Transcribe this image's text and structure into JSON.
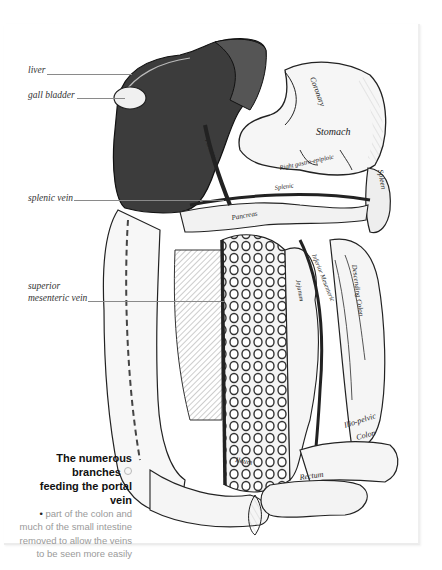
{
  "figure": {
    "labels": {
      "liver": "liver",
      "gall_bladder": "gall bladder",
      "splenic_vein": "splenic vein",
      "superior_mesenteric_vein_line1": "superior",
      "superior_mesenteric_vein_line2": "mesenteric vein"
    },
    "engraving_labels": {
      "coronary": "Coronary",
      "stomach": "Stomach",
      "right_gastroepiploic": "Right gastro-epiploic",
      "splenic": "Splenic",
      "pancreas": "Pancreas",
      "spleen": "Spleen",
      "portal_vein": "Portal Vein",
      "jejunum": "Jejunum",
      "inferior_mesenteric": "Inferior Mesenteric",
      "descending_colon": "Descending Colon",
      "ileum": "Ileum",
      "ilio_pelvic_colon_line1": "Ilio-pelvic",
      "ilio_pelvic_colon_line2": "Colon",
      "rectum": "Rectum"
    }
  },
  "caption": {
    "title_line1": "The numerous branches",
    "title_line2": "feeding the portal vein",
    "marker_icon": "circle-marker",
    "bullet": "•",
    "body_line1": "part of the colon and",
    "body_line2": "much of the small intestine",
    "body_line3": "removed to allow the veins",
    "body_line4": "to be seen more easily"
  },
  "colors": {
    "page": "#ffffff",
    "caption_title": "#111111",
    "caption_body": "#9a9a9a",
    "leader_line": "#8a8a8a",
    "liver_dark": "#3a3a3a"
  }
}
